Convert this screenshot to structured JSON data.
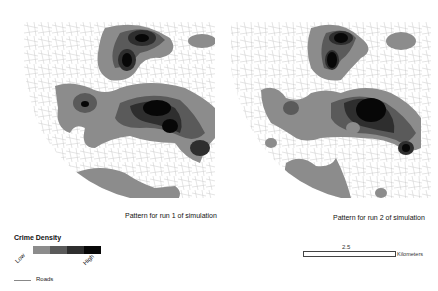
{
  "maps": [
    {
      "id": "map1",
      "caption": "Pattern for run 1 of simulation"
    },
    {
      "id": "map2",
      "caption": "Pattern for run 2 of simulation"
    }
  ],
  "legend": {
    "title": "Crime Density",
    "low_label": "Low",
    "high_label": "High",
    "classes": [
      "#8c8c8c",
      "#5a5a5a",
      "#2e2e2e",
      "#070707"
    ],
    "roads_label": "Roads",
    "roads_color": "#888888"
  },
  "scale_bar": {
    "value": "2.5",
    "unit": "Kilometers"
  },
  "colors": {
    "background": "#ffffff",
    "road": "#c8c8c8",
    "density_1": "#8c8c8c",
    "density_2": "#5a5a5a",
    "density_3": "#2e2e2e",
    "density_4": "#070707"
  }
}
